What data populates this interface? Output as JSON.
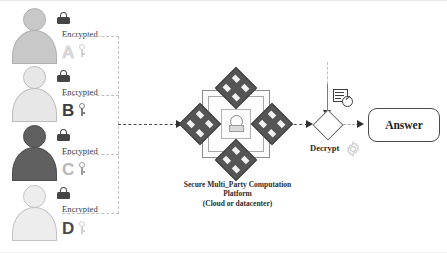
{
  "diagram": {
    "participants": [
      {
        "id": "a",
        "label": "A",
        "encrypted_text": "Encrypted",
        "lock_icon": "padlock-icon",
        "key_icon": "key-icon",
        "label_color": "#d9d9d9",
        "body_color": "#c8c8c8"
      },
      {
        "id": "b",
        "label": "B",
        "encrypted_text": "Encrypted",
        "lock_icon": "padlock-icon",
        "key_icon": "key-icon",
        "label_color": "#3c3c3c",
        "body_color": "#e7e7e7"
      },
      {
        "id": "c",
        "label": "C",
        "encrypted_text": "Encrypted",
        "lock_icon": "padlock-icon",
        "key_icon": "key-icon",
        "label_color": "#b8b8b8",
        "body_color": "#606060"
      },
      {
        "id": "d",
        "label": "D",
        "encrypted_text": "Encrypted",
        "lock_icon": "padlock-icon",
        "key_icon": "key-icon",
        "label_color": "#4a4a4a",
        "body_color": "#ededed"
      }
    ],
    "platform": {
      "caption_line1": "Secure Multi_Party Computation",
      "caption_line2": "Platform",
      "caption_line3": "(Cloud or datacenter)",
      "node_count": 4,
      "node_icon": "server-node-icon",
      "core_icon": "secure-lock-icon"
    },
    "decrypt": {
      "label": "Decrypt",
      "shape_icon": "diamond-decision-icon",
      "document_icon": "document-clock-icon",
      "gear_icon": "gear-icon"
    },
    "answer": {
      "label": "Answer"
    },
    "colors": {
      "node_fill": "#555555",
      "arrow": "#303030",
      "dashed_line": "#c0c0c0",
      "text": "#2b2b2b"
    }
  }
}
